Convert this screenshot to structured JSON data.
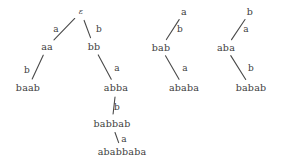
{
  "figure": {
    "kind": "derivation-tree-diagram",
    "background_color": "#ffffff",
    "text_color": "#3d3d3d",
    "edge_color": "#4a4a4a",
    "alphabet": [
      "a",
      "b"
    ],
    "trees": [
      {
        "id": "tree-1",
        "root": "ε",
        "nodes": [
          {
            "id": "t1-root",
            "label": "ε",
            "x": 81,
            "y": 12
          },
          {
            "id": "t1-aa",
            "label": "aa",
            "x": 47,
            "y": 47
          },
          {
            "id": "t1-baab",
            "label": "baab",
            "x": 28,
            "y": 88
          },
          {
            "id": "t1-bb",
            "label": "bb",
            "x": 94,
            "y": 47
          },
          {
            "id": "t1-abba",
            "label": "abba",
            "x": 116,
            "y": 88
          },
          {
            "id": "t1-babbab",
            "label": "babbab",
            "x": 112,
            "y": 124
          },
          {
            "id": "t1-ababbaba",
            "label": "ababbaba",
            "x": 122,
            "y": 152
          }
        ],
        "edges": [
          {
            "id": "t1-e1",
            "from": "t1-root",
            "to": "t1-aa",
            "label": "a",
            "label_x": 56,
            "label_y": 29
          },
          {
            "id": "t1-e2",
            "from": "t1-root",
            "to": "t1-bb",
            "label": "b",
            "label_x": 99,
            "label_y": 29
          },
          {
            "id": "t1-e3",
            "from": "t1-aa",
            "to": "t1-baab",
            "label": "b",
            "label_x": 27,
            "label_y": 70
          },
          {
            "id": "t1-e4",
            "from": "t1-bb",
            "to": "t1-abba",
            "label": "a",
            "label_x": 117,
            "label_y": 68
          },
          {
            "id": "t1-e5",
            "from": "t1-abba",
            "to": "t1-babbab",
            "label": "b",
            "label_x": 117,
            "label_y": 107
          },
          {
            "id": "t1-e6",
            "from": "t1-babbab",
            "to": "t1-ababbaba",
            "label": "a",
            "label_x": 124,
            "label_y": 139
          }
        ]
      },
      {
        "id": "tree-2",
        "root": "a",
        "nodes": [
          {
            "id": "t2-root",
            "label": "a",
            "x": 184,
            "y": 12
          },
          {
            "id": "t2-bab",
            "label": "bab",
            "x": 161,
            "y": 48
          },
          {
            "id": "t2-ababa",
            "label": "ababa",
            "x": 184,
            "y": 88
          }
        ],
        "edges": [
          {
            "id": "t2-e1",
            "from": "t2-root",
            "to": "t2-bab",
            "label": "b",
            "label_x": 180,
            "label_y": 29
          },
          {
            "id": "t2-e2",
            "from": "t2-bab",
            "to": "t2-ababa",
            "label": "a",
            "label_x": 185,
            "label_y": 68
          }
        ]
      },
      {
        "id": "tree-3",
        "root": "b",
        "nodes": [
          {
            "id": "t3-root",
            "label": "b",
            "x": 250,
            "y": 12
          },
          {
            "id": "t3-aba",
            "label": "aba",
            "x": 226,
            "y": 48
          },
          {
            "id": "t3-babab",
            "label": "babab",
            "x": 251,
            "y": 88
          }
        ],
        "edges": [
          {
            "id": "t3-e1",
            "from": "t3-root",
            "to": "t3-aba",
            "label": "a",
            "label_x": 246,
            "label_y": 29
          },
          {
            "id": "t3-e2",
            "from": "t3-aba",
            "to": "t3-babab",
            "label": "b",
            "label_x": 251,
            "label_y": 68
          }
        ]
      }
    ]
  }
}
